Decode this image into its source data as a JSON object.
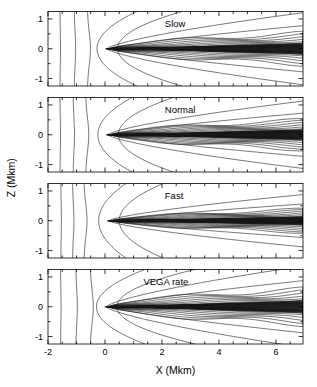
{
  "figure": {
    "title": "",
    "background_color": "#ffffff",
    "line_color": "#1a1a1a",
    "width_px": 317,
    "height_px": 387
  },
  "axes": {
    "x_title": "X (Mkm)",
    "y_title": "Z (Mkm)",
    "x_ticks": [
      "-2",
      "0",
      "2",
      "4",
      "6"
    ],
    "x_tick_values": [
      -2,
      0,
      2,
      4,
      6
    ],
    "x_minor_step": 0.5,
    "x_limits": [
      -2.0,
      6.95
    ],
    "y_ticks": [
      "1",
      "0",
      "-1"
    ],
    "y_tick_values": [
      1,
      0,
      -1
    ],
    "y_minor_step": 0.5,
    "y_limits": [
      -1.25,
      1.25
    ]
  },
  "panels": [
    {
      "id": "slow",
      "label": "Slow",
      "label_x": 2.1,
      "label_y": 0.82
    },
    {
      "id": "normal",
      "label": "Normal",
      "label_x": 2.1,
      "label_y": 0.82
    },
    {
      "id": "fast",
      "label": "Fast",
      "label_x": 2.1,
      "label_y": 0.82
    },
    {
      "id": "vega_rate",
      "label": "VEGA rate",
      "label_x": 1.35,
      "label_y": 0.82
    }
  ],
  "chart_data": {
    "type": "line",
    "plot_kind": "contour",
    "title": "",
    "xlabel": "X (Mkm)",
    "ylabel": "Z (Mkm)",
    "xlim": [
      -2.0,
      6.95
    ],
    "ylim": [
      -1.25,
      1.25
    ],
    "xticks": [
      -2,
      0,
      2,
      4,
      6
    ],
    "yticks": [
      -1,
      0,
      1
    ],
    "grid": false,
    "legend": "none",
    "panel_labels": [
      "Slow",
      "Normal",
      "Fast",
      "VEGA rate"
    ],
    "series": [
      {
        "name": "slow",
        "upstream_vertical_contours_x": [
          -1.58,
          -1.08,
          -0.62
        ],
        "bow_front_apex_x": 0.02,
        "bow_front_edge_x_at_z1": 0.78,
        "tail_contour_count": 9,
        "tail_opening_z_at_xmax": 0.62,
        "darkening": "moderate"
      },
      {
        "name": "normal",
        "upstream_vertical_contours_x": [
          -1.58,
          -1.12,
          -0.68
        ],
        "bow_front_apex_x": 0.05,
        "bow_front_edge_x_at_z1": 0.7,
        "tail_contour_count": 10,
        "tail_opening_z_at_xmax": 0.58,
        "darkening": "strong"
      },
      {
        "name": "fast",
        "upstream_vertical_contours_x": [
          -1.55,
          -1.14,
          -0.74
        ],
        "bow_front_apex_x": 0.08,
        "bow_front_edge_x_at_z1": 0.6,
        "tail_contour_count": 10,
        "tail_opening_z_at_xmax": 0.45,
        "darkening": "very strong"
      },
      {
        "name": "vega_rate",
        "upstream_vertical_contours_x": [
          -1.56,
          -1.02,
          -0.52
        ],
        "bow_front_apex_x": 0.0,
        "bow_front_edge_x_at_z1": 0.92,
        "tail_contour_count": 9,
        "tail_opening_z_at_xmax": 0.7,
        "darkening": "strong"
      }
    ]
  }
}
